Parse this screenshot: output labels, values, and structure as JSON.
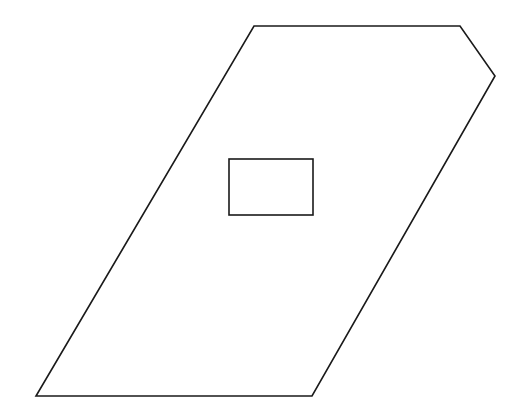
{
  "diagram": {
    "background": "#ffffff",
    "stroke_color": "#1a1a1a",
    "stroke_width": 1.6,
    "shapes": [
      {
        "name": "outer-pentagon",
        "type": "polygon",
        "points": [
          [
            254,
            26
          ],
          [
            460,
            26
          ],
          [
            495,
            76
          ],
          [
            312,
            396
          ],
          [
            36,
            396
          ]
        ]
      },
      {
        "name": "inner-rectangle",
        "type": "rect",
        "x": 229,
        "y": 159,
        "width": 84,
        "height": 56
      }
    ]
  }
}
